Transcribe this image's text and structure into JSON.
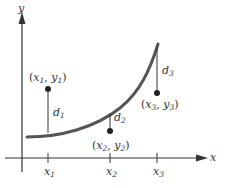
{
  "diagram": {
    "axes": {
      "x_label": "x",
      "y_label": "y"
    },
    "ticks": [
      {
        "base": "x",
        "sub": "1"
      },
      {
        "base": "x",
        "sub": "2"
      },
      {
        "base": "x",
        "sub": "3"
      }
    ],
    "points": [
      {
        "x_base": "x",
        "x_sub": "1",
        "y_base": "y",
        "y_sub": "1"
      },
      {
        "x_base": "x",
        "x_sub": "2",
        "y_base": "y",
        "y_sub": "2"
      },
      {
        "x_base": "x",
        "x_sub": "3",
        "y_base": "y",
        "y_sub": "3"
      }
    ],
    "distances": [
      {
        "base": "d",
        "sub": "1"
      },
      {
        "base": "d",
        "sub": "2"
      },
      {
        "base": "d",
        "sub": "3"
      }
    ],
    "colors": {
      "curve": "#555555",
      "axis": "#333333",
      "point": "#222222"
    }
  }
}
